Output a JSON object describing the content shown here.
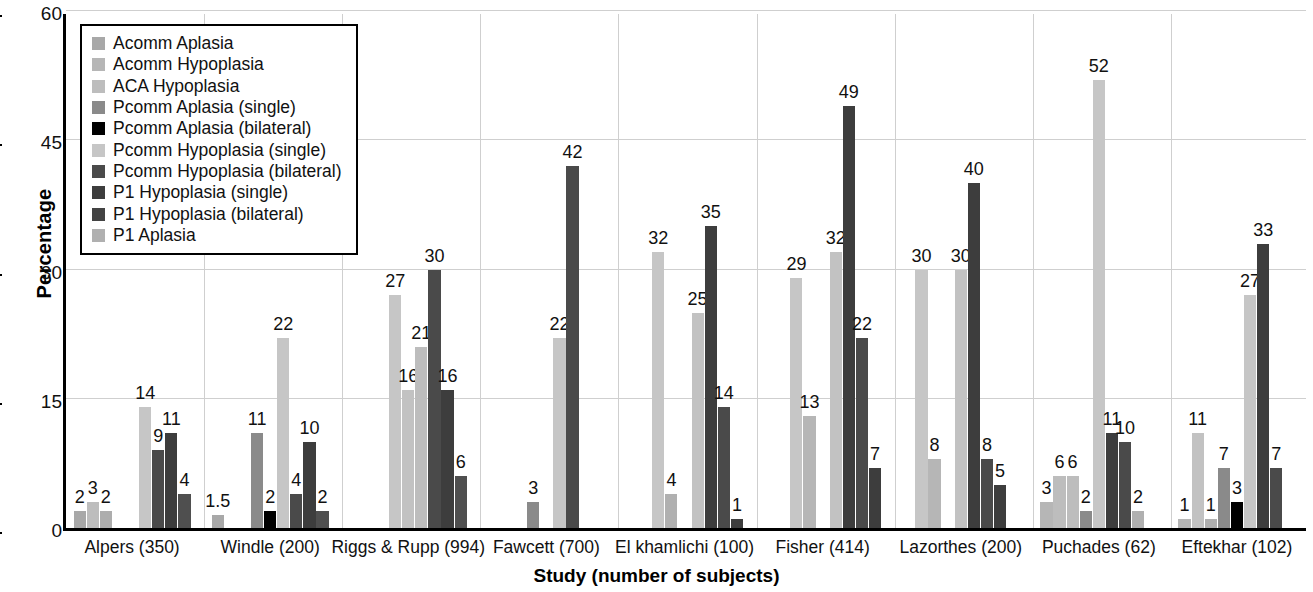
{
  "chart_data": {
    "type": "bar",
    "title": "",
    "xlabel": "Study (number of subjects)",
    "ylabel": "Percentage",
    "ylim": [
      0,
      60
    ],
    "yticks": [
      0,
      15,
      30,
      45,
      60
    ],
    "grid": true,
    "legend_position": "top-left inside",
    "categories": [
      "Alpers (350)",
      "Windle (200)",
      "Riggs & Rupp (994)",
      "Fawcett (700)",
      "El khamlichi (100)",
      "Fisher (414)",
      "Lazorthes (200)",
      "Puchades (62)",
      "Eftekhar (102)"
    ],
    "series": [
      {
        "name": "Acomm Aplasia",
        "color": "#a8a8a8",
        "values": [
          2,
          1.5,
          null,
          null,
          null,
          null,
          null,
          3,
          1
        ]
      },
      {
        "name": "Acomm Hypoplasia",
        "color": "#b8b8b8",
        "values": [
          3,
          null,
          null,
          null,
          null,
          null,
          null,
          6,
          11
        ]
      },
      {
        "name": "ACA Hypoplasia",
        "color": "#adadad",
        "values": [
          2,
          null,
          null,
          null,
          null,
          null,
          null,
          6,
          1
        ]
      },
      {
        "name": "Pcomm Aplasia (single)",
        "color": "#8a8a8a",
        "values": [
          null,
          11,
          null,
          3,
          null,
          null,
          null,
          2,
          7
        ]
      },
      {
        "name": "Pcomm Aplasia (bilateral)",
        "color": "#000000",
        "values": [
          null,
          2,
          null,
          null,
          null,
          null,
          null,
          null,
          3
        ]
      },
      {
        "name": "Pcomm Hypoplasia (single)",
        "color": "#c6c6c6",
        "values": [
          14,
          22,
          27,
          22,
          32,
          29,
          30,
          52,
          27
        ]
      },
      {
        "name": "Pcomm Hypoplasia (bilateral)",
        "color": "#4a4a4a",
        "values": [
          9,
          4,
          null,
          42,
          4,
          13,
          8,
          11,
          33
        ]
      },
      {
        "name": "P1 Hypoplasia (single)",
        "color": "#3d3d3d",
        "values": [
          11,
          10,
          16,
          null,
          25,
          32,
          30,
          10,
          7
        ]
      },
      {
        "name": "P1 Hypoplasia (bilateral)",
        "color": "#4f4f4f",
        "values": [
          4,
          2,
          21,
          null,
          35,
          49,
          40,
          2,
          null
        ]
      },
      {
        "name": "P1 Aplasia",
        "color": "#b0b0b0",
        "values": [
          null,
          null,
          30,
          null,
          14,
          22,
          8,
          null,
          null
        ]
      }
    ],
    "extra_bars": [
      {
        "group": "Riggs & Rupp (994)",
        "slot": 7,
        "value": 16,
        "color": "#4a4a4a"
      },
      {
        "group": "Riggs & Rupp (994)",
        "slot": 8,
        "value": 6,
        "color": "#4f4f4f"
      },
      {
        "group": "El khamlichi (100)",
        "slot": 9,
        "value": 1,
        "color": "#3d3d3d"
      },
      {
        "group": "Fisher (414)",
        "slot": 9,
        "value": 7,
        "color": "#3d3d3d"
      },
      {
        "group": "Lazorthes (200)",
        "slot": 9,
        "value": 5,
        "color": "#3d3d3d"
      }
    ]
  },
  "rendered_bars": [
    {
      "g": 0,
      "s": 1,
      "v": 2,
      "c": "#a8a8a8"
    },
    {
      "g": 0,
      "s": 2,
      "v": 3,
      "c": "#bdbdbd"
    },
    {
      "g": 0,
      "s": 3,
      "v": 2,
      "c": "#adadad"
    },
    {
      "g": 0,
      "s": 6,
      "v": 14,
      "c": "#c6c6c6"
    },
    {
      "g": 0,
      "s": 7,
      "v": 9,
      "c": "#4a4a4a"
    },
    {
      "g": 0,
      "s": 8,
      "v": 11,
      "c": "#3d3d3d"
    },
    {
      "g": 0,
      "s": 9,
      "v": 4,
      "c": "#4f4f4f"
    },
    {
      "g": 1,
      "s": 1,
      "v": 1.5,
      "c": "#a8a8a8"
    },
    {
      "g": 1,
      "s": 4,
      "v": 11,
      "c": "#8a8a8a"
    },
    {
      "g": 1,
      "s": 5,
      "v": 2,
      "c": "#000000"
    },
    {
      "g": 1,
      "s": 6,
      "v": 22,
      "c": "#c6c6c6"
    },
    {
      "g": 1,
      "s": 7,
      "v": 4,
      "c": "#4a4a4a"
    },
    {
      "g": 1,
      "s": 8,
      "v": 10,
      "c": "#3d3d3d"
    },
    {
      "g": 1,
      "s": 9,
      "v": 2,
      "c": "#4f4f4f"
    },
    {
      "g": 2,
      "s": 4,
      "v": 27,
      "c": "#c6c6c6"
    },
    {
      "g": 2,
      "s": 5,
      "v": 16,
      "c": "#c2c2c2"
    },
    {
      "g": 2,
      "s": 6,
      "v": 21,
      "c": "#bdbdbd"
    },
    {
      "g": 2,
      "s": 7,
      "v": 30,
      "c": "#4a4a4a"
    },
    {
      "g": 2,
      "s": 8,
      "v": 16,
      "c": "#3d3d3d"
    },
    {
      "g": 2,
      "s": 9,
      "v": 6,
      "c": "#4f4f4f"
    },
    {
      "g": 3,
      "s": 4,
      "v": 3,
      "c": "#8a8a8a"
    },
    {
      "g": 3,
      "s": 6,
      "v": 22,
      "c": "#c6c6c6"
    },
    {
      "g": 3,
      "s": 7,
      "v": 42,
      "c": "#4a4a4a"
    },
    {
      "g": 4,
      "s": 3,
      "v": 32,
      "c": "#c6c6c6"
    },
    {
      "g": 4,
      "s": 4,
      "v": 4,
      "c": "#b0b0b0"
    },
    {
      "g": 4,
      "s": 6,
      "v": 25,
      "c": "#c2c2c2"
    },
    {
      "g": 4,
      "s": 7,
      "v": 35,
      "c": "#3d3d3d"
    },
    {
      "g": 4,
      "s": 8,
      "v": 14,
      "c": "#4a4a4a"
    },
    {
      "g": 4,
      "s": 9,
      "v": 1,
      "c": "#3d3d3d"
    },
    {
      "g": 5,
      "s": 3,
      "v": 29,
      "c": "#c6c6c6"
    },
    {
      "g": 5,
      "s": 4,
      "v": 13,
      "c": "#b6b6b6"
    },
    {
      "g": 5,
      "s": 6,
      "v": 32,
      "c": "#c2c2c2"
    },
    {
      "g": 5,
      "s": 7,
      "v": 49,
      "c": "#3d3d3d"
    },
    {
      "g": 5,
      "s": 8,
      "v": 22,
      "c": "#4a4a4a"
    },
    {
      "g": 5,
      "s": 9,
      "v": 7,
      "c": "#3d3d3d"
    },
    {
      "g": 6,
      "s": 2,
      "v": 30,
      "c": "#c6c6c6"
    },
    {
      "g": 6,
      "s": 3,
      "v": 8,
      "c": "#b6b6b6"
    },
    {
      "g": 6,
      "s": 5,
      "v": 30,
      "c": "#c2c2c2"
    },
    {
      "g": 6,
      "s": 6,
      "v": 40,
      "c": "#3d3d3d"
    },
    {
      "g": 6,
      "s": 7,
      "v": 8,
      "c": "#4a4a4a"
    },
    {
      "g": 6,
      "s": 8,
      "v": 5,
      "c": "#3d3d3d"
    },
    {
      "g": 7,
      "s": 1,
      "v": 3,
      "c": "#b6b6b6"
    },
    {
      "g": 7,
      "s": 2,
      "v": 6,
      "c": "#bdbdbd"
    },
    {
      "g": 7,
      "s": 3,
      "v": 6,
      "c": "#bdbdbd"
    },
    {
      "g": 7,
      "s": 4,
      "v": 2,
      "c": "#8a8a8a"
    },
    {
      "g": 7,
      "s": 5,
      "v": 52,
      "c": "#c6c6c6"
    },
    {
      "g": 7,
      "s": 6,
      "v": 11,
      "c": "#3d3d3d"
    },
    {
      "g": 7,
      "s": 7,
      "v": 10,
      "c": "#4a4a4a"
    },
    {
      "g": 7,
      "s": 8,
      "v": 2,
      "c": "#b0b0b0"
    },
    {
      "g": 8,
      "s": 1,
      "v": 1,
      "c": "#b6b6b6"
    },
    {
      "g": 8,
      "s": 2,
      "v": 11,
      "c": "#c2c2c2"
    },
    {
      "g": 8,
      "s": 3,
      "v": 1,
      "c": "#b0b0b0"
    },
    {
      "g": 8,
      "s": 4,
      "v": 7,
      "c": "#8a8a8a"
    },
    {
      "g": 8,
      "s": 5,
      "v": 3,
      "c": "#000000"
    },
    {
      "g": 8,
      "s": 6,
      "v": 27,
      "c": "#c6c6c6"
    },
    {
      "g": 8,
      "s": 7,
      "v": 33,
      "c": "#3d3d3d"
    },
    {
      "g": 8,
      "s": 8,
      "v": 7,
      "c": "#4a4a4a"
    }
  ],
  "legend": {
    "items": [
      {
        "label": "Acomm Aplasia",
        "color": "#a8a8a8"
      },
      {
        "label": "Acomm Hypoplasia",
        "color": "#b6b6b6"
      },
      {
        "label": "ACA Hypoplasia",
        "color": "#bdbdbd"
      },
      {
        "label": "Pcomm Aplasia (single)",
        "color": "#8a8a8a"
      },
      {
        "label": "Pcomm Aplasia (bilateral)",
        "color": "#000000"
      },
      {
        "label": "Pcomm Hypoplasia (single)",
        "color": "#c6c6c6"
      },
      {
        "label": "Pcomm Hypoplasia (bilateral)",
        "color": "#4a4a4a"
      },
      {
        "label": "P1 Hypoplasia (single)",
        "color": "#3d3d3d"
      },
      {
        "label": "P1 Hypoplasia (bilateral)",
        "color": "#434343"
      },
      {
        "label": "P1 Aplasia",
        "color": "#b0b0b0"
      }
    ]
  }
}
